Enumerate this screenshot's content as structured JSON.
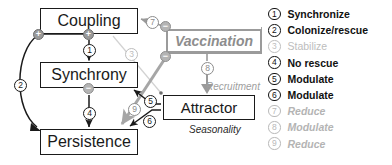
{
  "diagram": {
    "nodes": {
      "coupling": "Coupling",
      "synchrony": "Synchrony",
      "persistence": "Persistence",
      "attractor": "Attractor",
      "vaccination": "Vaccination"
    },
    "annotations": {
      "recruitment": "Recruitment",
      "seasonality": "Seasonality"
    },
    "signs": {
      "coupling_left": "+",
      "coupling_bottom": "+",
      "synchrony_bottom": "−",
      "vaccination_top": "−",
      "vaccination_bottom": "−"
    },
    "edge_markers": [
      {
        "id": "1",
        "tone": "dark"
      },
      {
        "id": "2",
        "tone": "dark"
      },
      {
        "id": "3",
        "tone": "pale"
      },
      {
        "id": "4",
        "tone": "dark"
      },
      {
        "id": "5",
        "tone": "dark"
      },
      {
        "id": "6",
        "tone": "dark"
      },
      {
        "id": "7",
        "tone": "mid"
      },
      {
        "id": "8",
        "tone": "mid"
      },
      {
        "id": "9",
        "tone": "mid"
      }
    ],
    "colors": {
      "black": "#1a1a1a",
      "gray": "#8d8d8d",
      "pale": "#c9c9c9",
      "mid_gray": "#9a9a9a",
      "white": "#ffffff"
    }
  },
  "legend": {
    "items": [
      {
        "num": "1",
        "label": "Synchronize",
        "style": "dark"
      },
      {
        "num": "2",
        "label": "Colonize/rescue",
        "style": "dark"
      },
      {
        "num": "3",
        "label": "Stabilize",
        "style": "fade2"
      },
      {
        "num": "4",
        "label": "No rescue",
        "style": "dark"
      },
      {
        "num": "5",
        "label": "Modulate",
        "style": "dark"
      },
      {
        "num": "6",
        "label": "Modulate",
        "style": "dark"
      },
      {
        "num": "7",
        "label": "Reduce",
        "style": "fade"
      },
      {
        "num": "8",
        "label": "Modulate",
        "style": "fade"
      },
      {
        "num": "9",
        "label": "Reduce",
        "style": "fade"
      }
    ]
  }
}
